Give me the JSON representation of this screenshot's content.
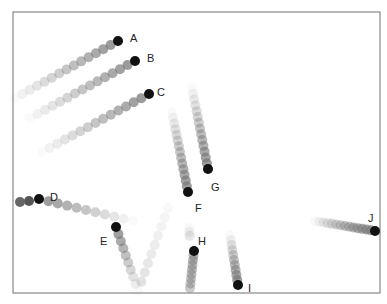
{
  "figure": {
    "frame": {
      "x": 13,
      "y": 12,
      "w": 367,
      "h": 281,
      "stroke": "#888888"
    },
    "dot_radius": 5,
    "head_color": "#111111",
    "trail_color": "#777777",
    "objects": [
      {
        "label": "A",
        "head": [
          118,
          41
        ],
        "tail": [
          15,
          98
        ],
        "steps": 14,
        "label_pos": [
          130,
          38
        ]
      },
      {
        "label": "B",
        "head": [
          135,
          61
        ],
        "tail": [
          30,
          118
        ],
        "steps": 14,
        "label_pos": [
          147,
          58
        ]
      },
      {
        "label": "C",
        "head": [
          149,
          94
        ],
        "tail": [
          42,
          152
        ],
        "steps": 14,
        "label_pos": [
          157,
          92
        ]
      },
      {
        "label": "D",
        "head": [
          39,
          199
        ],
        "tail": [
          133,
          221
        ],
        "steps": 10,
        "label_pos": [
          50,
          197
        ]
      },
      {
        "label": "D-back",
        "head": [
          29,
          201
        ],
        "tail": [
          20,
          202
        ],
        "steps": 1,
        "hidden_label": true
      },
      {
        "label": "E",
        "head": [
          116,
          227
        ],
        "tail": [
          138,
          291
        ],
        "steps": 9,
        "label_pos": [
          100,
          241
        ]
      },
      {
        "label": "E-rise",
        "head": [
          138,
          291
        ],
        "tail": [
          168,
          208
        ],
        "steps": 9,
        "hidden_label": true,
        "faint": true
      },
      {
        "label": "F",
        "head": [
          188,
          192
        ],
        "tail": [
          172,
          112
        ],
        "steps": 14,
        "label_pos": [
          195,
          208
        ]
      },
      {
        "label": "G",
        "head": [
          208,
          169
        ],
        "tail": [
          192,
          88
        ],
        "steps": 14,
        "label_pos": [
          211,
          187
        ]
      },
      {
        "label": "H",
        "head": [
          194,
          251
        ],
        "tail": [
          190,
          288
        ],
        "steps": 8,
        "label_pos": [
          198,
          241
        ],
        "reverse_fade": true
      },
      {
        "label": "H-up",
        "head": [
          190,
          240
        ],
        "tail": [
          189,
          228
        ],
        "steps": 3,
        "hidden_label": true,
        "faint": true
      },
      {
        "label": "I",
        "head": [
          238,
          285
        ],
        "tail": [
          230,
          235
        ],
        "steps": 10,
        "label_pos": [
          248,
          288
        ]
      },
      {
        "label": "J",
        "head": [
          375,
          231
        ],
        "tail": [
          315,
          221
        ],
        "steps": 14,
        "label_pos": [
          368,
          218
        ]
      }
    ]
  }
}
